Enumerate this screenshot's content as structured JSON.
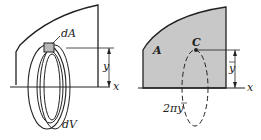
{
  "left_figure": {
    "labels": {
      "area_element": "dA",
      "volume_element": "dV",
      "height": "y",
      "axis": "x"
    }
  },
  "right_figure": {
    "labels": {
      "area": "A",
      "centroid": "C",
      "height": "y",
      "axis": "x",
      "path_length": "2πy"
    },
    "colors": {
      "area_fill": "#c8c8c8",
      "stroke": "#222222"
    }
  }
}
